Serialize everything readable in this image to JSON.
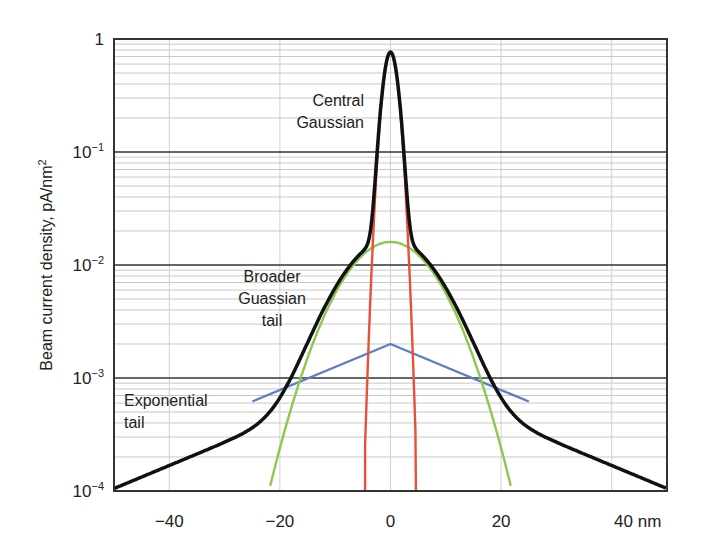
{
  "chart_data": {
    "type": "line",
    "title": "",
    "xlabel": "nm",
    "ylabel": "Beam current density, pA/nm²",
    "xscale": "linear",
    "yscale": "log",
    "xlim": [
      -50,
      50
    ],
    "ylim": [
      0.0001,
      1
    ],
    "grid": true,
    "legend": null,
    "x_ticks": [
      {
        "value": -40,
        "label": "−40"
      },
      {
        "value": -20,
        "label": "−20"
      },
      {
        "value": 0,
        "label": "0"
      },
      {
        "value": 20,
        "label": "20"
      },
      {
        "value": 40,
        "label": "40 nm"
      }
    ],
    "y_ticks": [
      {
        "value": 1,
        "label": "1",
        "base": "1",
        "exp": ""
      },
      {
        "value": 0.1,
        "label": "10⁻¹",
        "base": "10",
        "exp": "−1"
      },
      {
        "value": 0.01,
        "label": "10⁻²",
        "base": "10",
        "exp": "−2"
      },
      {
        "value": 0.001,
        "label": "10⁻³",
        "base": "10",
        "exp": "−3"
      },
      {
        "value": 0.0001,
        "label": "10⁻⁴",
        "base": "10",
        "exp": "−4"
      }
    ],
    "series": [
      {
        "name": "Total (sum)",
        "color": "#111111",
        "x": [
          -50,
          -45,
          -40,
          -35,
          -30,
          -25,
          -22,
          -20,
          -18,
          -15,
          -12,
          -10,
          -8,
          -6,
          -5,
          -4,
          -3,
          -2,
          -1,
          0,
          1,
          2,
          3,
          4,
          5,
          6,
          8,
          10,
          12,
          15,
          18,
          20,
          22,
          25,
          30,
          35,
          40,
          45,
          50
        ],
        "y": [
          0.00017,
          0.00022,
          0.00029,
          0.00037,
          0.00048,
          0.00065,
          0.00085,
          0.0011,
          0.0016,
          0.0027,
          0.0048,
          0.0075,
          0.011,
          0.014,
          0.016,
          0.02,
          0.05,
          0.15,
          0.45,
          0.75,
          0.45,
          0.15,
          0.05,
          0.02,
          0.016,
          0.014,
          0.011,
          0.0075,
          0.0048,
          0.0027,
          0.0016,
          0.0011,
          0.00085,
          0.00065,
          0.00048,
          0.00037,
          0.00029,
          0.00022,
          0.00017
        ]
      },
      {
        "name": "Central Gaussian",
        "color": "#e8503a",
        "x": [
          -4.5,
          -4,
          -3,
          -2,
          -1,
          0,
          1,
          2,
          3,
          4,
          4.5
        ],
        "y": [
          0.0001,
          0.0006,
          0.02,
          0.15,
          0.45,
          0.75,
          0.45,
          0.15,
          0.02,
          0.0006,
          0.0001
        ]
      },
      {
        "name": "Broader Gaussian tail",
        "color": "#8cc84b",
        "x": [
          -23,
          -20,
          -18,
          -15,
          -12,
          -10,
          -8,
          -5,
          -2,
          0,
          2,
          5,
          8,
          10,
          12,
          15,
          18,
          20,
          23
        ],
        "y": [
          0.0001,
          0.00045,
          0.001,
          0.0025,
          0.0048,
          0.0075,
          0.01,
          0.013,
          0.015,
          0.016,
          0.015,
          0.013,
          0.01,
          0.0075,
          0.0048,
          0.0025,
          0.001,
          0.00045,
          0.0001
        ]
      },
      {
        "name": "Exponential tail",
        "color": "#5b7fc7",
        "x": [
          -25,
          0,
          25
        ],
        "y": [
          0.00062,
          0.002,
          0.00062
        ]
      }
    ],
    "annotations": [
      {
        "text": [
          "Central",
          "Gaussian"
        ],
        "x": -3,
        "y": 0.3
      },
      {
        "text": [
          "Broader",
          "Guassian",
          "tail"
        ],
        "x": -22,
        "y": 0.006
      },
      {
        "text": [
          "Exponential",
          "tail"
        ],
        "x": -48,
        "y": 0.0007
      }
    ]
  },
  "labels": {
    "y_axis": "Beam current density, pA/nm",
    "y_axis_sup": "2",
    "annot_central_1": "Central",
    "annot_central_2": "Gaussian",
    "annot_broad_1": "Broader",
    "annot_broad_2": "Guassian",
    "annot_broad_3": "tail",
    "annot_exp_1": "Exponential",
    "annot_exp_2": "tail"
  }
}
